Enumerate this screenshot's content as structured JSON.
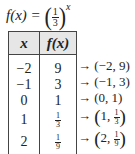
{
  "formula": {
    "lhs": "f(x) =",
    "base_numerator": "1",
    "base_denominator": "3",
    "exponent": "x",
    "open_paren": "(",
    "close_paren": ")"
  },
  "table": {
    "headers": [
      "x",
      "f(x)"
    ],
    "rows": [
      {
        "x": "−2",
        "fx": "9",
        "fx_is_fraction": false,
        "point_x": "−2",
        "point_y": "9"
      },
      {
        "x": "−1",
        "fx": "3",
        "fx_is_fraction": false,
        "point_x": "−1",
        "point_y": "3"
      },
      {
        "x": "0",
        "fx": "1",
        "fx_is_fraction": false,
        "point_x": "0",
        "point_y": "1"
      },
      {
        "x": "1",
        "fx_num": "1",
        "fx_den": "3",
        "fx_is_fraction": true,
        "point_x": "1"
      },
      {
        "x": "2",
        "fx_num": "1",
        "fx_den": "9",
        "fx_is_fraction": true,
        "point_x": "2"
      }
    ]
  },
  "points": {
    "arrow": "→",
    "p0": "(−2, 9)",
    "p1": "(−1, 3)",
    "p2": "(0, 1)",
    "p3_prefix": "1, ",
    "p3_num": "1",
    "p3_den": "3",
    "p4_prefix": "2, ",
    "p4_num": "1",
    "p4_den": "9",
    "open": "(",
    "close": ")"
  }
}
